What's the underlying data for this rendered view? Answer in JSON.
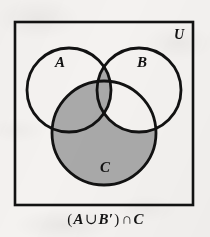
{
  "figure": {
    "type": "venn-diagram",
    "set_count": 3,
    "universe_label": "U",
    "labels": {
      "a": "A",
      "b": "B",
      "c": "C",
      "universe": "U"
    },
    "caption": {
      "full_text": "(A ∪ B′) ∩ C",
      "open_paren": "(",
      "set_a": "A",
      "union_operator": "∪",
      "set_b_complement": "B′",
      "close_paren": ")",
      "intersection_operator": "∩",
      "set_c": "C"
    },
    "shaded_description": "(A ∪ B′) ∩ C",
    "shaded_regions": [
      "A ∩ B′ ∩ C",
      "A ∩ B ∩ C",
      "A′ ∩ B′ ∩ C"
    ],
    "unshaded_regions": [
      "A ∩ B′ ∩ C′",
      "A ∩ B ∩ C′",
      "A′ ∩ B ∩ C′",
      "A′ ∩ B ∩ C",
      "A′ ∩ B′ ∩ C′"
    ],
    "colors": {
      "shading": "#a9a9a9",
      "outline": "#121212",
      "background": "#f4f2f0",
      "text": "#141414"
    },
    "geometry": {
      "universe_box": {
        "x": 15,
        "y": 22,
        "width": 178,
        "height": 183
      },
      "circle_a": {
        "cx": 69,
        "cy": 90,
        "r": 42
      },
      "circle_b": {
        "cx": 139,
        "cy": 90,
        "r": 42
      },
      "circle_c": {
        "cx": 104,
        "cy": 133,
        "r": 52
      },
      "label_a": {
        "x": 60,
        "y": 66
      },
      "label_b": {
        "x": 141,
        "y": 66
      },
      "label_c": {
        "x": 105,
        "y": 170
      },
      "label_u": {
        "x": 178,
        "y": 38
      }
    }
  }
}
